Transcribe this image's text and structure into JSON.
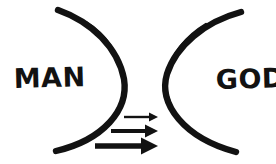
{
  "diagram": {
    "background_color": "#ffffff",
    "ink_color": "#121212",
    "labels": {
      "left": "MAN",
      "right": "GOD"
    },
    "shapes": {
      "left_arc": {
        "name": "left-arc",
        "description": "thick hand-drawn arc bulging to the right, enclosing MAN",
        "stroke_color": "#121212",
        "stroke_width": 6
      },
      "right_arc": {
        "name": "right-arc",
        "description": "thick hand-drawn arc bulging to the left, enclosing GOD",
        "stroke_color": "#121212",
        "stroke_width": 6
      }
    },
    "arrows": [
      {
        "name": "arrow-top",
        "direction": "right",
        "label": "",
        "thickness": 2,
        "length": 32,
        "x_start": 124,
        "x_end": 157,
        "y": 117
      },
      {
        "name": "arrow-middle",
        "direction": "right",
        "label": "",
        "thickness": 4,
        "length": 46,
        "x_start": 111,
        "x_end": 157,
        "y": 131
      },
      {
        "name": "arrow-bottom",
        "direction": "right",
        "label": "",
        "thickness": 6,
        "length": 62,
        "x_start": 95,
        "x_end": 157,
        "y": 146
      }
    ]
  }
}
